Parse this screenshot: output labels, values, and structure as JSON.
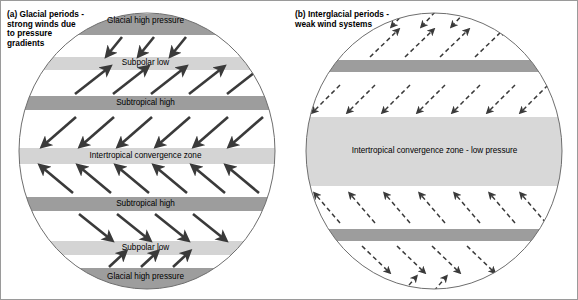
{
  "figure": {
    "background": "#ffffff",
    "frame_color": "#9a9a9a",
    "high_pressure_color": "#9d9d9d",
    "low_pressure_color": "#d4d4d4",
    "arrow_color": "#3a3a3a",
    "circle_outline_color": "#6e6e6e"
  },
  "panels": [
    {
      "id": "a",
      "caption": "(a) Glacial periods -\nstrong winds due\nto pressure\ngradients",
      "wind_style": "solid-bold",
      "bands": [
        {
          "name": "glacial-high-pressure-north",
          "label": "Glacial high\npressure",
          "type": "high",
          "y": 13,
          "height": 21
        },
        {
          "name": "subpolar-low-north",
          "label": "Subpolar low",
          "type": "low",
          "y": 56,
          "height": 13
        },
        {
          "name": "subtropical-high-north",
          "label": "Subtropical high",
          "type": "high",
          "y": 95,
          "height": 14
        },
        {
          "name": "intertropical-convergence-zone",
          "label": "Intertropical convergence zone",
          "type": "low",
          "y": 147,
          "height": 16
        },
        {
          "name": "subtropical-high-south",
          "label": "Subtropical high",
          "type": "high",
          "y": 196,
          "height": 14
        },
        {
          "name": "subpolar-low-south",
          "label": "Subpolar low",
          "type": "low",
          "y": 240,
          "height": 14
        },
        {
          "name": "glacial-high-pressure-south",
          "label": "Glacial high pressure",
          "type": "high",
          "y": 267,
          "height": 20
        }
      ]
    },
    {
      "id": "b",
      "caption": "(b) Interglacial periods -\nweak wind systems",
      "wind_style": "dashed-thin",
      "bands": [
        {
          "name": "high-pressure-north",
          "label": "",
          "type": "high",
          "y": 59,
          "height": 12
        },
        {
          "name": "intertropical-convergence-zone-low-pressure",
          "label": "Intertropical convergence zone - low pressure",
          "type": "low",
          "y": 116,
          "height": 69
        },
        {
          "name": "high-pressure-south",
          "label": "",
          "type": "high",
          "y": 228,
          "height": 12
        }
      ]
    }
  ]
}
